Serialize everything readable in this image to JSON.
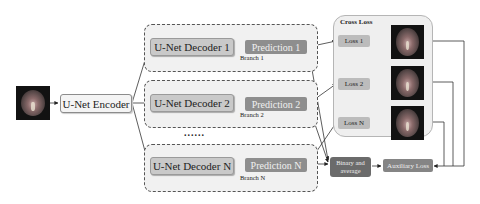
{
  "input": {
    "icon": "brain-mri-image"
  },
  "encoder": {
    "label": "U-Net Encoder"
  },
  "branches": [
    {
      "decoder": "U-Net Decoder 1",
      "prediction": "Prediction 1",
      "branch": "Branch 1"
    },
    {
      "decoder": "U-Net Decoder 2",
      "prediction": "Prediction 2",
      "branch": "Branch 2"
    },
    {
      "decoder": "U-Net Decoder N",
      "prediction": "Prediction N",
      "branch": "Branch N"
    }
  ],
  "ellipsis": "......",
  "cross_loss": {
    "title": "Cross Loss",
    "losses": [
      "Loss 1",
      "Loss 2",
      "Loss N"
    ]
  },
  "binary_average": "Binary and average",
  "auxiliary_loss": "Auxiliary Loss",
  "colors": {
    "decoder": "#c9c9c9",
    "prediction": "#8e8e8e",
    "loss": "#bcbcbc",
    "binary": "#6b6b6b",
    "auxiliary": "#858585"
  }
}
